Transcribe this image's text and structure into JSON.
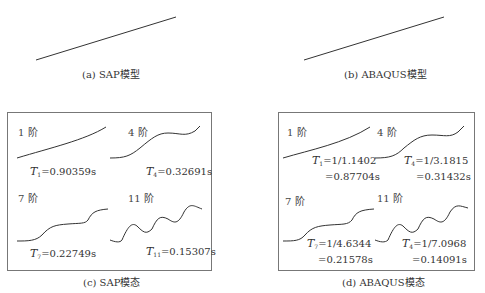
{
  "panels": {
    "a": {
      "caption": "(a) SAP模型"
    },
    "b": {
      "caption": "(b) ABAQUS模型"
    },
    "c": {
      "caption": "(c) SAP模态",
      "modes": [
        {
          "label": "1 阶",
          "T": "T",
          "sub": "1",
          "value": "=0.90359s"
        },
        {
          "label": "4 阶",
          "T": "T",
          "sub": "4",
          "value": "=0.32691s"
        },
        {
          "label": "7 阶",
          "T": "T",
          "sub": "7",
          "value": "=0.22749s"
        },
        {
          "label": "11 阶",
          "T": "T",
          "sub": "11",
          "value": "=0.15307s"
        }
      ]
    },
    "d": {
      "caption": "(d) ABAQUS模态",
      "modes": [
        {
          "label": "1 阶",
          "T": "T",
          "sub": "1",
          "value": "=1/1.1402",
          "value2": "=0.87704s"
        },
        {
          "label": "4 阶",
          "T": "T",
          "sub": "4",
          "value": "=1/3.1815",
          "value2": "=0.31432s"
        },
        {
          "label": "7 阶",
          "T": "T",
          "sub": "7",
          "value": "=1/4.6344",
          "value2": "=0.21578s"
        },
        {
          "label": "11 阶",
          "T": "T",
          "sub": "4",
          "value": "=1/7.0968",
          "value2": "=0.14091s"
        }
      ]
    }
  },
  "colors": {
    "line": "#333333",
    "border": "#777777"
  }
}
